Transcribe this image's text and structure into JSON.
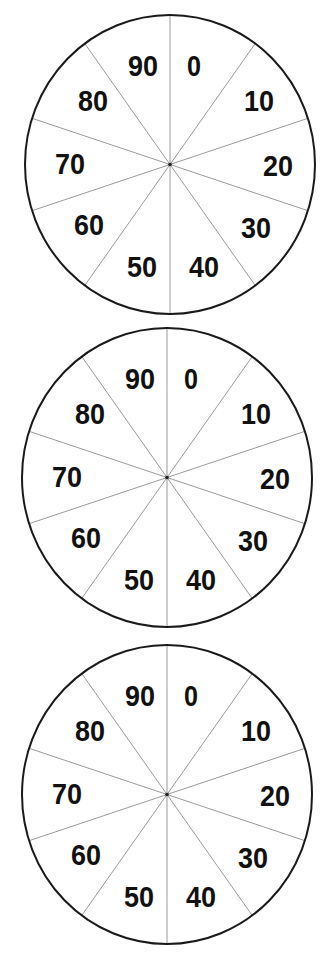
{
  "dials": [
    {
      "name": "dial-1",
      "cx": 170,
      "cy": 164.5,
      "rx": 145,
      "ry": 149.5,
      "labels": [
        "0",
        "10",
        "20",
        "30",
        "40",
        "50",
        "60",
        "70",
        "80",
        "90"
      ]
    },
    {
      "name": "dial-2",
      "cx": 167,
      "cy": 477.5,
      "rx": 145,
      "ry": 149.5,
      "labels": [
        "0",
        "10",
        "20",
        "30",
        "40",
        "50",
        "60",
        "70",
        "80",
        "90"
      ]
    },
    {
      "name": "dial-3",
      "cx": 167,
      "cy": 794.5,
      "rx": 145,
      "ry": 149.5,
      "labels": [
        "0",
        "10",
        "20",
        "30",
        "40",
        "50",
        "60",
        "70",
        "80",
        "90"
      ]
    }
  ],
  "label_offsets": [
    [
      24,
      -99
    ],
    [
      89,
      -64
    ],
    [
      108,
      1
    ],
    [
      86,
      63
    ],
    [
      34,
      102
    ],
    [
      -28,
      102
    ],
    [
      -81,
      60
    ],
    [
      -100,
      -1
    ],
    [
      -77,
      -64
    ],
    [
      -27,
      -99
    ]
  ],
  "colors": {
    "outline": "#1a1a1a",
    "spoke": "#9a9a9a",
    "text": "#111111",
    "background": "#ffffff"
  },
  "segments": 10
}
